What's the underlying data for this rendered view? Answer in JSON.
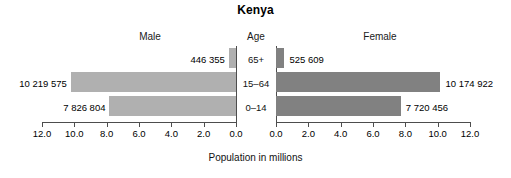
{
  "chart_data": {
    "type": "bar",
    "subtype": "population-pyramid",
    "title": "Kenya",
    "xlabel": "Population in millions",
    "ylabel": "Age",
    "categories": [
      "65+",
      "15–64",
      "0–14"
    ],
    "axis_ticks": [
      "0.0",
      "2.0",
      "4.0",
      "6.0",
      "8.0",
      "10.0",
      "12.0"
    ],
    "left_axis_ticks": [
      "12.0",
      "10.0",
      "8.0",
      "6.0",
      "4.0",
      "2.0",
      "0.0"
    ],
    "right_axis_ticks": [
      "0.0",
      "2.0",
      "4.0",
      "6.0",
      "8.0",
      "10.0",
      "12.0"
    ],
    "xlim": [
      0,
      12
    ],
    "grid": false,
    "legend_position": "column-headers",
    "series": [
      {
        "name": "Male",
        "color": "#b0b0b0",
        "side": "left",
        "values": [
          0.446355,
          10.219575,
          7.826804
        ],
        "labels": [
          "446 355",
          "10 219 575",
          "7 826 804"
        ]
      },
      {
        "name": "Female",
        "color": "#818181",
        "side": "right",
        "values": [
          0.525609,
          10.174922,
          7.720456
        ],
        "labels": [
          "525 609",
          "10 174 922",
          "7 720 456"
        ]
      }
    ]
  },
  "headers": {
    "male": "Male",
    "age": "Age",
    "female": "Female"
  },
  "colors": {
    "male_bar": "#b0b0b0",
    "female_bar": "#818181",
    "axis": "#4d4d4d",
    "text": "#000000",
    "background": "#ffffff"
  }
}
